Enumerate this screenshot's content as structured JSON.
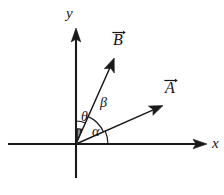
{
  "figure": {
    "kind": "vector-angle-diagram",
    "background_color": "#ffffff",
    "ink_color": "#1a1a1a",
    "axes": {
      "x_label": "x",
      "y_label": "y",
      "origin": {
        "x": 76,
        "y": 144
      },
      "x_axis": {
        "start_x": 8,
        "end_x": 207,
        "y": 144,
        "arrow": "right"
      },
      "y_axis": {
        "x": 76,
        "start_y": 178,
        "end_y": 28,
        "arrow": "up"
      }
    },
    "vectors": [
      {
        "name": "A",
        "label": "A",
        "notation": "overline-arrow",
        "from": {
          "x": 76,
          "y": 144
        },
        "to": {
          "x": 162,
          "y": 106
        },
        "angle_from_x_axis_deg": 24,
        "label_pos": {
          "x": 166,
          "y": 82
        }
      },
      {
        "name": "B",
        "label": "B",
        "notation": "overline-arrow",
        "from": {
          "x": 76,
          "y": 144
        },
        "to": {
          "x": 114,
          "y": 58
        },
        "angle_from_x_axis_deg": 66,
        "label_pos": {
          "x": 114,
          "y": 34
        }
      }
    ],
    "angles": [
      {
        "name": "alpha",
        "symbol": "α",
        "between": [
          "x-axis",
          "A"
        ],
        "radius": 32,
        "start_deg": 0,
        "end_deg": 24,
        "label_pos": {
          "x": 95,
          "y": 128
        }
      },
      {
        "name": "beta",
        "symbol": "β",
        "between": [
          "A",
          "B"
        ],
        "radius": 30,
        "start_deg": 24,
        "end_deg": 66,
        "label_pos": {
          "x": 104,
          "y": 102
        }
      },
      {
        "name": "theta",
        "symbol": "θ",
        "between": [
          "y-axis",
          "B"
        ],
        "radius": 23,
        "start_deg": 66,
        "end_deg": 90,
        "label_pos": {
          "x": 85,
          "y": 114
        }
      }
    ],
    "hatched_sector": {
      "name": "theta-hatched-sector",
      "between": [
        "y-axis",
        "B"
      ],
      "radius": 15,
      "start_deg": 66,
      "end_deg": 90,
      "fill": "none",
      "hatch_direction": "vertical",
      "hatch_count": 4
    }
  }
}
